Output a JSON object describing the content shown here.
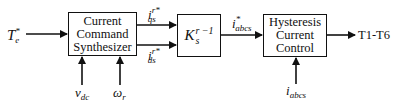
{
  "blocks": {
    "synth": {
      "line1": "Current",
      "line2": "Command",
      "line3": "Synthesizer"
    },
    "transform": {
      "base": "K",
      "sub": "s",
      "sup": "r −1"
    },
    "hysteresis": {
      "line1": "Hysteresis",
      "line2": "Current",
      "line3": "Control"
    }
  },
  "signals": {
    "torque_ref": {
      "base": "T",
      "sub": "e",
      "sup": "*"
    },
    "iqs": {
      "base": "i",
      "sub": "qs",
      "sup": "r*"
    },
    "ids": {
      "base": "i",
      "sub": "ds",
      "sup": "r*"
    },
    "iabcs_ref": {
      "base": "i",
      "sub": "abcs",
      "sup": "*"
    },
    "vdc": {
      "base": "v",
      "sub": "dc"
    },
    "omega": {
      "base": "ω",
      "sub": "r"
    },
    "iabcs": {
      "base": "i",
      "sub": "abcs"
    },
    "output": "T1-T6"
  }
}
